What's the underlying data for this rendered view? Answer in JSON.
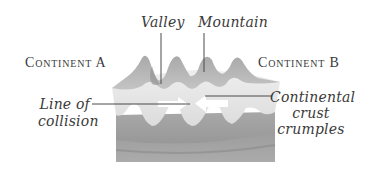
{
  "diagram": {
    "labels": {
      "continent_a": "Continent A",
      "continent_b": "Continent B",
      "valley": "Valley",
      "mountain": "Mountain",
      "line_of_collision_1": "Line of",
      "line_of_collision_2": "collision",
      "crust_1": "Continental",
      "crust_2": "crust",
      "crust_3": "crumples"
    },
    "arrows": [
      {
        "name": "continent-a-motion",
        "direction": "right"
      },
      {
        "name": "continent-b-motion",
        "direction": "left"
      }
    ],
    "colors": {
      "mountain_dark": "#9a9a9a",
      "mountain_mid": "#b8b8b8",
      "crust_light": "#e2e2e2",
      "mantle_upper": "#a6a6a6",
      "mantle_lower": "#8e8e8e",
      "leader_line": "#4a4a4a",
      "text": "#3a3a3a"
    }
  }
}
